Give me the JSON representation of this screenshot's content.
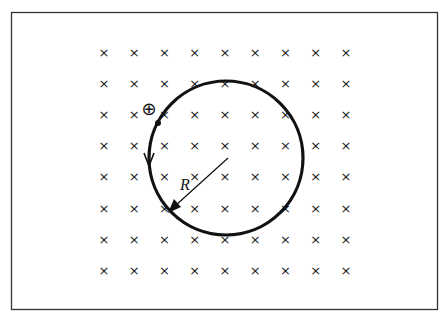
{
  "diagram": {
    "field": {
      "symbol": "×",
      "direction": "into page",
      "columns": 9,
      "rows": 8
    },
    "particle": {
      "label": "⊕",
      "charge": "positive"
    },
    "path": {
      "shape": "circle",
      "direction": "counterclockwise"
    },
    "radius_label": "R",
    "colors": {
      "ink": "#111111",
      "border": "#333333",
      "background": "#ffffff"
    }
  }
}
